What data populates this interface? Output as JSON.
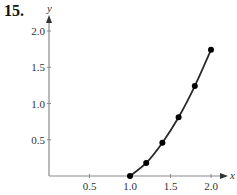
{
  "problem_label": "15.",
  "chart_data": {
    "type": "line",
    "title": "",
    "xlabel": "x",
    "ylabel": "y",
    "x": [
      1.0,
      1.2,
      1.4,
      1.6,
      1.8,
      2.0
    ],
    "series": [
      {
        "name": "curve",
        "values": [
          0,
          0.18,
          0.46,
          0.81,
          1.24,
          1.74
        ],
        "markers": true
      }
    ],
    "xlim": [
      0,
      2.1
    ],
    "ylim": [
      0,
      2.1
    ],
    "xticks": [
      "0.5",
      "1.0",
      "1.5",
      "2.0"
    ],
    "yticks": [
      "0.5",
      "1.0",
      "1.5",
      "2.0"
    ],
    "grid": false,
    "legend": null
  },
  "colors": {
    "axis": "#8a8a8a",
    "curve": "#2a2a2a",
    "marker": "#000000"
  }
}
